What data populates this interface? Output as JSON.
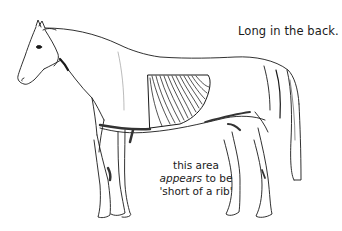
{
  "figure": {
    "title": "Long in the back.",
    "caption": {
      "line1": "this area",
      "line2_emphasis": "appears",
      "line2_rest": " to be",
      "line3": "'short of a rib'"
    },
    "illustration": {
      "subject": "horse-side-profile",
      "highlight": "rib-cage",
      "line_color": "#1a1a1a",
      "background": "#ffffff"
    }
  }
}
